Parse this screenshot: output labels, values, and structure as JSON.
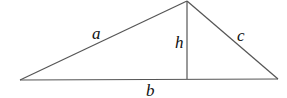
{
  "diagram": {
    "type": "triangle-with-altitude",
    "stroke_color": "#555555",
    "label_color": "#111111",
    "vertices": {
      "left": [
        20,
        80
      ],
      "apex": [
        187,
        1
      ],
      "right": [
        278,
        79
      ],
      "foot": [
        187,
        79
      ]
    },
    "labels": {
      "left_side": "a",
      "altitude": "h",
      "right_side": "c",
      "base": "b"
    }
  }
}
